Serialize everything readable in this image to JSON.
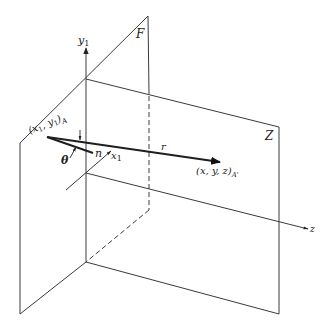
{
  "diagram": {
    "planes": {
      "front_plane_label": "F",
      "receiving_plane_label": "Z"
    },
    "axes": {
      "vertical_label": "y",
      "vertical_sub": "1",
      "horizontal_label": "x",
      "horizontal_sub": "1",
      "depth_label": "z"
    },
    "points": {
      "source_label": "(x",
      "source_label_mid": ", y",
      "source_label_end": ")",
      "source_sub1": "1",
      "source_sub2": "1",
      "source_subscript": "A",
      "target_label": "(x, y, z)",
      "target_subscript": "A'"
    },
    "vectors": {
      "normal_label": "n",
      "distance_label": "r"
    },
    "angles": {
      "theta_label": "θ",
      "psi_label": "ψ"
    },
    "colors": {
      "ink": "#222222",
      "background": "#ffffff"
    }
  }
}
